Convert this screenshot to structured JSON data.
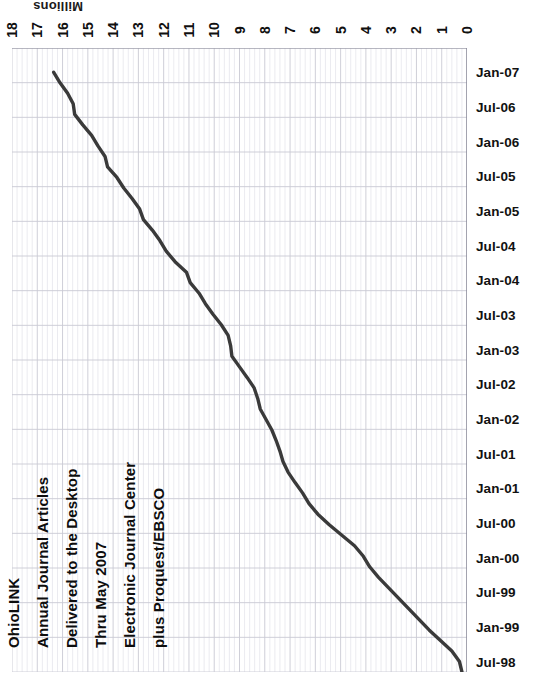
{
  "chart_data": {
    "type": "line",
    "title_lines": [
      "OhioLINK",
      "Annual Journal Articles",
      "Delivered to the Desktop",
      "Thru May 2007",
      "Electronic Journal Center",
      "plus Proquest/EBSCO"
    ],
    "orientation": "rotated-90-dates-vertical-values-horizontal",
    "xlabel": "Millions",
    "ylabel": "",
    "value_axis_label": "Millions",
    "value_ticks": [
      18,
      17,
      16,
      15,
      14,
      13,
      12,
      11,
      10,
      9,
      8,
      7,
      6,
      5,
      4,
      3,
      2,
      1,
      0
    ],
    "value_axis_min": 0,
    "value_axis_max": 18,
    "value_axis_direction": "descending-left-to-right",
    "grid": true,
    "grid_minor": true,
    "legend": "none",
    "line_color": "#3a3a3a",
    "grid_color": "#c9c9d4",
    "categories": [
      "Jan-07",
      "Jul-06",
      "Jan-06",
      "Jul-05",
      "Jan-05",
      "Jul-04",
      "Jan-04",
      "Jul-03",
      "Jan-03",
      "Jul-02",
      "Jan-02",
      "Jul-01",
      "Jan-01",
      "Jul-00",
      "Jan-00",
      "Jul-99",
      "Jan-99",
      "Jul-98"
    ],
    "values": [
      16.35,
      15.55,
      14.25,
      13.55,
      12.85,
      12.05,
      11.05,
      10.35,
      9.35,
      8.25,
      7.75,
      7.25,
      6.45,
      5.45,
      3.95,
      3.15,
      2.25,
      1.15
    ],
    "units": "millions of articles",
    "series": [
      {
        "name": "Annual journal articles delivered",
        "values": [
          16.35,
          15.55,
          14.25,
          13.55,
          12.85,
          12.05,
          11.05,
          10.35,
          9.35,
          8.25,
          7.75,
          7.25,
          6.45,
          5.45,
          3.95,
          3.15,
          2.25,
          1.15
        ]
      }
    ],
    "dense_points": [
      16.35,
      16.1,
      15.8,
      15.58,
      15.52,
      15.2,
      14.85,
      14.6,
      14.32,
      14.22,
      13.85,
      13.58,
      13.25,
      12.95,
      12.8,
      12.45,
      12.15,
      11.9,
      11.55,
      11.1,
      10.95,
      10.6,
      10.35,
      10.05,
      9.72,
      9.45,
      9.35,
      9.3,
      9.0,
      8.7,
      8.42,
      8.28,
      8.18,
      7.95,
      7.72,
      7.55,
      7.4,
      7.28,
      7.08,
      6.8,
      6.5,
      6.25,
      5.9,
      5.45,
      4.95,
      4.45,
      4.1,
      3.85,
      3.5,
      3.1,
      2.7,
      2.3,
      1.9,
      1.5,
      1.05,
      0.6,
      0.3,
      0.2
    ]
  }
}
